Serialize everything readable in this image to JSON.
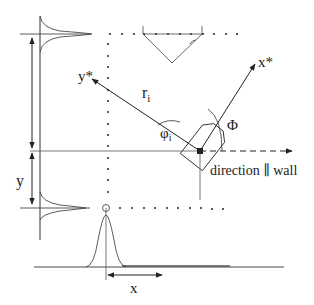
{
  "diagram": {
    "labels": {
      "y_star": "y*",
      "x_star": "x*",
      "r_i": "r",
      "r_i_sub": "i",
      "phi_i": "φ",
      "phi_i_sub": "i",
      "Phi": "Φ",
      "direction": "direction ∥ wall",
      "y": "y",
      "x": "x"
    },
    "colors": {
      "line": "#333333",
      "dots": "#222222",
      "background": "#ffffff"
    }
  }
}
